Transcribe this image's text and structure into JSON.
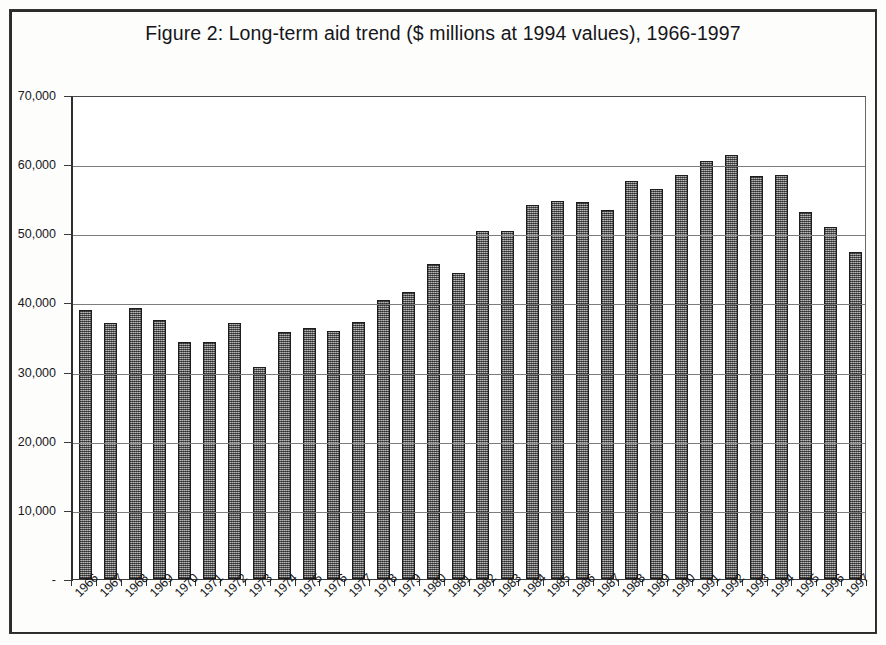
{
  "chart_data": {
    "type": "bar",
    "title": "Figure 2: Long-term aid trend ($ millions at 1994 values), 1966-1997",
    "xlabel": "",
    "ylabel": "",
    "ylim": [
      0,
      70000
    ],
    "grid": true,
    "legend": "none",
    "categories": [
      "1966",
      "1967",
      "1968",
      "1969",
      "1970",
      "1971",
      "1972",
      "1973",
      "1974",
      "1975",
      "1976",
      "1977",
      "1978",
      "1979",
      "1980",
      "1981",
      "1982",
      "1983",
      "1984",
      "1985",
      "1986",
      "1987",
      "1988",
      "1989",
      "1990",
      "1991",
      "1992",
      "1993",
      "1994",
      "1995",
      "1996",
      "1997"
    ],
    "values": [
      38900,
      37000,
      39200,
      37400,
      34300,
      34300,
      37000,
      30600,
      35700,
      36300,
      35900,
      37200,
      40400,
      41500,
      45500,
      44300,
      50400,
      50400,
      54100,
      54700,
      54500,
      53300,
      57600,
      56400,
      58500,
      60400,
      61300,
      58300,
      58500,
      53100,
      50900,
      47300
    ],
    "ytick_labels": [
      "70,000",
      "60,000",
      "50,000",
      "40,000",
      "30,000",
      "20,000",
      "10,000",
      "-"
    ],
    "ytick_values": [
      70000,
      60000,
      50000,
      40000,
      30000,
      20000,
      10000,
      0
    ],
    "bar_fill_color": "#8e8e8e",
    "bar_edge_color": "#1d1d1d",
    "gridline_color": "#7d7d7d",
    "axis_color": "#2e2e2e",
    "background_color": "#ffffff"
  }
}
